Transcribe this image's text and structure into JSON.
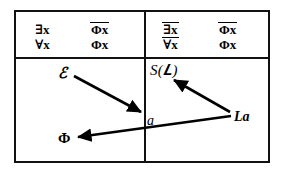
{
  "figure": {
    "background_color": "#ffffff",
    "ink_color": "#000000",
    "width": 283,
    "height": 180
  },
  "table": {
    "columns": 2,
    "rows": 2,
    "header_row": {
      "left_cell": {
        "quantifier_column": {
          "top": {
            "text": "∃x",
            "overline": false
          },
          "bottom": {
            "text": "∀x",
            "overline": false
          }
        },
        "formula_column": {
          "top": {
            "text": "Φx",
            "overline": true
          },
          "bottom": {
            "text": "Φx",
            "overline": false
          }
        }
      },
      "right_cell": {
        "quantifier_column": {
          "top": {
            "text": "∃x",
            "overline": true
          },
          "bottom": {
            "text": "∀x",
            "overline": true
          }
        },
        "formula_column": {
          "top": {
            "text": "Φx",
            "overline": true
          },
          "bottom": {
            "text": "Φx",
            "overline": false
          }
        }
      }
    },
    "body_row": {
      "left_cell": {
        "nodes": [
          {
            "id": "script-s",
            "label": "ℰ"
          },
          {
            "id": "phi",
            "label": "Φ"
          }
        ]
      },
      "right_cell": {
        "nodes": [
          {
            "id": "s-of-x",
            "label": "S(𝑳)"
          },
          {
            "id": "la",
            "label": "La"
          },
          {
            "id": "a",
            "label": "a"
          }
        ]
      }
    }
  },
  "arrows": [
    {
      "id": "arrow-s-to-a",
      "from": "script-s",
      "to": "a",
      "style": "solid-filled-head"
    },
    {
      "id": "arrow-la-to-sx",
      "from": "la",
      "to": "s-of-x",
      "style": "solid-filled-head"
    },
    {
      "id": "arrow-la-to-phi",
      "from": "la",
      "to": "phi",
      "style": "solid-filled-head"
    }
  ]
}
